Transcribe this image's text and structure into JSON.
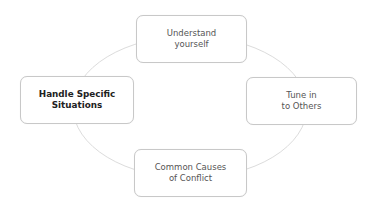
{
  "diagram": {
    "type": "cycle",
    "ring_color": "#dcdcdc",
    "node_border_color": "#c8c8c8",
    "nodes": [
      {
        "id": "top",
        "line1": "Understand",
        "line2": "yourself",
        "bold": false
      },
      {
        "id": "right",
        "line1": "Tune in",
        "line2": "to Others",
        "bold": false
      },
      {
        "id": "bottom",
        "line1": "Common Causes",
        "line2": "of Conflict",
        "bold": false
      },
      {
        "id": "left",
        "line1": "Handle Specific",
        "line2": "Situations",
        "bold": true
      }
    ]
  }
}
